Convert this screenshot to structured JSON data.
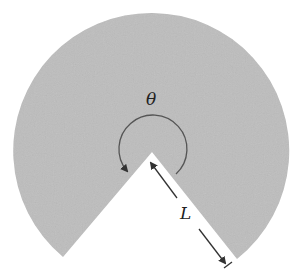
{
  "diagram": {
    "type": "circular-sector",
    "fill_color": "#bdbdbd",
    "line_color": "#444444",
    "labels": {
      "angle": "θ",
      "radius": "L"
    },
    "geometry": {
      "center": [
        152,
        152
      ],
      "radius": 138,
      "gap_start_deg": 51.5,
      "gap_end_deg": 130
    }
  }
}
